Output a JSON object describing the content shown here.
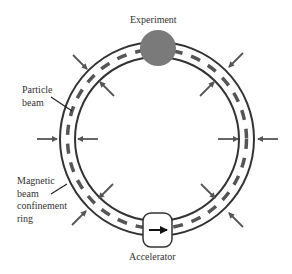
{
  "diagram": {
    "type": "particle accelerator ring",
    "labels": {
      "experiment": "Experiment",
      "accelerator": "Accelerator",
      "particle_beam": [
        "Particle",
        "beam"
      ],
      "confinement_ring": [
        "Magnetic",
        "beam",
        "confinement",
        "ring"
      ]
    },
    "colors": {
      "ring": "#333333",
      "beam": "#555555",
      "experiment": "#7a7a7a",
      "arrow": "#555555",
      "text": "#333333"
    },
    "geometry": {
      "center": [
        157,
        139
      ],
      "outer_radius": 97,
      "inner_radius": 82,
      "beam_radius": 90
    }
  }
}
